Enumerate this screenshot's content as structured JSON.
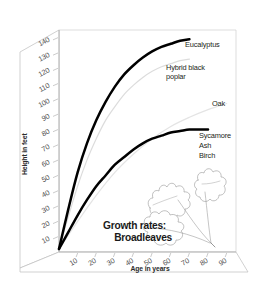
{
  "chart_data": {
    "type": "line",
    "title": "Growth rates: Broadleaves",
    "title_line1": "Growth rates:",
    "title_line2": "Broadleaves",
    "xlabel": "Age in years",
    "ylabel": "Height in feet",
    "xlim": [
      0,
      95
    ],
    "ylim": [
      0,
      145
    ],
    "xticks": [
      10,
      20,
      30,
      40,
      50,
      60,
      70,
      80,
      90
    ],
    "yticks": [
      10,
      20,
      30,
      40,
      50,
      60,
      70,
      80,
      90,
      100,
      110,
      120,
      130,
      140
    ],
    "grid": false,
    "legend_position": "inline-right",
    "projection": "3d-box",
    "series": [
      {
        "name": "Eucalyptus",
        "label": "Eucalyptus",
        "color": "#000000",
        "style": "thick-black",
        "x": [
          0,
          5,
          10,
          15,
          20,
          25,
          30,
          35,
          40,
          45,
          50,
          55,
          60,
          65,
          70
        ],
        "y": [
          2,
          28,
          52,
          71,
          86,
          98,
          108,
          116,
          122,
          127,
          131,
          134,
          136,
          138,
          139
        ]
      },
      {
        "name": "Hybrid black poplar",
        "label": "Hybrid black poplar",
        "color": "#dcdcdc",
        "style": "thin-grey",
        "x": [
          0,
          5,
          10,
          15,
          20,
          25,
          30,
          35,
          40,
          45,
          50,
          55,
          60,
          65,
          70
        ],
        "y": [
          2,
          23,
          43,
          60,
          74,
          86,
          95,
          103,
          109,
          114,
          118,
          121,
          123,
          125,
          126
        ]
      },
      {
        "name": "Oak",
        "label": "Oak",
        "color": "#e4e4e4",
        "style": "thin-grey",
        "x": [
          0,
          10,
          20,
          30,
          40,
          50,
          60,
          70,
          80,
          90
        ],
        "y": [
          2,
          20,
          37,
          52,
          64,
          74,
          82,
          88,
          93,
          97
        ]
      },
      {
        "name": "Sycamore Ash Birch",
        "label": "Sycamore\nAsh\nBirch",
        "label_lines": [
          "Sycamore",
          "Ash",
          "Birch"
        ],
        "color": "#000000",
        "style": "thick-black",
        "x": [
          0,
          5,
          10,
          15,
          20,
          25,
          30,
          35,
          40,
          45,
          50,
          55,
          60,
          65,
          70,
          75,
          80
        ],
        "y": [
          2,
          13,
          24,
          34,
          43,
          50,
          57,
          62,
          67,
          71,
          74,
          76,
          78,
          79,
          80,
          80,
          80
        ]
      }
    ],
    "annotations": [
      {
        "name": "oak-leaf-illustration",
        "text": ""
      }
    ]
  }
}
